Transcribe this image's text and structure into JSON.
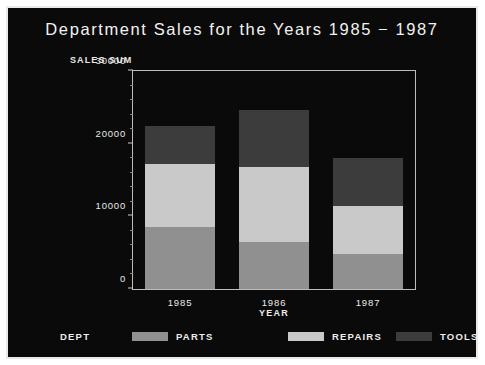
{
  "chart_data": {
    "type": "bar",
    "subtype": "stacked-bar",
    "title": "Department Sales for the Years 1985 − 1987",
    "xlabel": "YEAR",
    "ylabel": "SALES SUM",
    "legend_title": "DEPT",
    "legend_position": "bottom",
    "grid": false,
    "categories": [
      "1985",
      "1986",
      "1987"
    ],
    "ylim": [
      0,
      30000
    ],
    "ytick_labels": [
      "0",
      "10000",
      "20000",
      "30000"
    ],
    "ytick_values": [
      0,
      10000,
      20000,
      30000
    ],
    "yminor_step": 2000,
    "stack_order_bottom_to_top": [
      "PARTS",
      "REPAIRS",
      "TOOLS"
    ],
    "series": [
      {
        "name": "PARTS",
        "color": "#909090",
        "values": [
          8500,
          6500,
          4800
        ]
      },
      {
        "name": "REPAIRS",
        "color": "#c9c9c9",
        "values": [
          8700,
          10300,
          6600
        ]
      },
      {
        "name": "TOOLS",
        "color": "#3c3c3c",
        "values": [
          5200,
          7800,
          6600
        ]
      }
    ],
    "totals": [
      22400,
      24600,
      18000
    ]
  },
  "chart": {
    "title": "Department Sales for the Years 1985 − 1987",
    "ylabel": "SALES SUM",
    "xlabel": "YEAR",
    "yticks": [
      {
        "label": "30000",
        "value": 30000
      },
      {
        "label": "20000",
        "value": 20000
      },
      {
        "label": "10000",
        "value": 10000
      },
      {
        "label": "0",
        "value": 0
      }
    ],
    "xticks": [
      {
        "label": "1985"
      },
      {
        "label": "1986"
      },
      {
        "label": "1987"
      }
    ],
    "legend": {
      "title": "DEPT",
      "items": [
        {
          "label": "PARTS",
          "color": "#909090"
        },
        {
          "label": "REPAIRS",
          "color": "#c9c9c9"
        },
        {
          "label": "TOOLS",
          "color": "#3c3c3c"
        }
      ]
    },
    "colors": {
      "background": "#0a0a0a",
      "frame": "#e9e9e9",
      "axis": "#bdbdbd",
      "text": "#ededed"
    }
  }
}
